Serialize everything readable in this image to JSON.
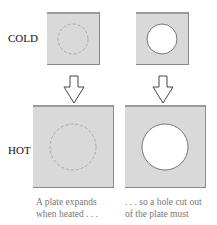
{
  "rows": {
    "cold_label": "COLD",
    "hot_label": "HOT"
  },
  "columns": [
    {
      "name": "solid-plate",
      "caption_line1": "A plate expands",
      "caption_line2": "when heated . . ."
    },
    {
      "name": "plate-with-hole",
      "caption_line1": ". . . so a hole cut out",
      "caption_line2": "of the plate must"
    }
  ],
  "colors": {
    "plate_fill": "#d9d9d9",
    "plate_edge": "#8a8a8a",
    "dashed_circle": "#aaaaaa",
    "hole_fill": "#ffffff",
    "arrow_stroke": "#444444"
  }
}
